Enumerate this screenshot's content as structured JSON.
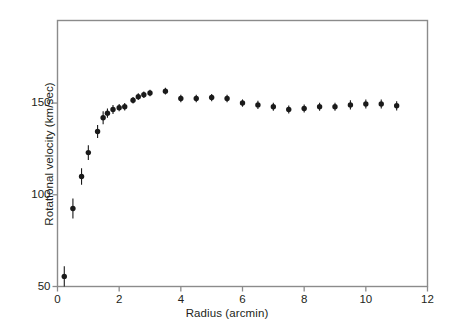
{
  "figure": {
    "background_color": "#ffffff",
    "frame_color": "#8b8b8b",
    "marker_color": "#1a1a1a"
  },
  "axes": {
    "x_title": "Radius (arcmin)",
    "y_title": "Rotational velocity (km/sec)",
    "x_ticks": [
      "0",
      "2",
      "4",
      "6",
      "8",
      "10",
      "12"
    ],
    "y_ticks": [
      "50",
      "100",
      "150"
    ]
  },
  "chart_data": {
    "type": "scatter",
    "title": "",
    "xlabel": "Radius (arcmin)",
    "ylabel": "Rotational velocity (km/sec)",
    "xlim": [
      0,
      12
    ],
    "ylim": [
      50,
      195
    ],
    "xticks": [
      0,
      2,
      4,
      6,
      8,
      10,
      12
    ],
    "yticks": [
      50,
      100,
      150
    ],
    "grid": false,
    "legend": "none",
    "marker": "filled-circle",
    "errorbars": "vertical",
    "series": [
      {
        "name": "Rotation curve",
        "x": [
          0.22,
          0.5,
          0.78,
          1.0,
          1.3,
          1.48,
          1.62,
          1.8,
          2.0,
          2.18,
          2.45,
          2.62,
          2.8,
          3.0,
          3.5,
          4.0,
          4.5,
          5.0,
          5.5,
          6.0,
          6.5,
          7.0,
          7.5,
          8.0,
          8.5,
          9.0,
          9.5,
          10.0,
          10.5,
          11.0
        ],
        "y": [
          55.5,
          92.5,
          110.0,
          123.0,
          134.5,
          142.0,
          144.5,
          146.5,
          147.5,
          148.0,
          151.5,
          153.5,
          154.5,
          155.5,
          156.5,
          152.5,
          152.5,
          153.0,
          152.5,
          150.0,
          149.0,
          148.0,
          146.5,
          147.0,
          148.0,
          148.0,
          149.0,
          149.5,
          149.5,
          148.5
        ],
        "yerr": [
          5.5,
          5.5,
          4.5,
          4.0,
          3.5,
          3.5,
          2.5,
          2.5,
          2.0,
          2.0,
          1.8,
          1.8,
          1.8,
          1.8,
          1.8,
          2.0,
          2.0,
          2.0,
          2.0,
          2.0,
          2.2,
          2.2,
          2.2,
          2.2,
          2.2,
          2.2,
          2.5,
          2.5,
          2.5,
          2.5
        ]
      }
    ]
  }
}
